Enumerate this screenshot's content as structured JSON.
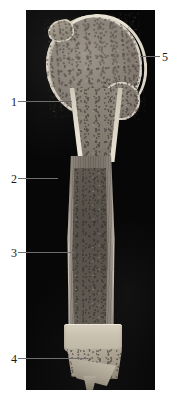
{
  "figure": {
    "background_color": "#ffffff",
    "panel_color": "#070707",
    "leader_line_color": "#6e6e6e",
    "numeral_color": "#1a1a1a",
    "specimen": "longitudinal section of a long bone (humerus)",
    "panel": {
      "x": 26,
      "y": 10,
      "width": 129,
      "height": 380
    }
  },
  "callouts": [
    {
      "id": "callout-1",
      "label": "1",
      "side": "left",
      "number_x": 11,
      "number_y": 96,
      "line_x": 18,
      "line_y": 101,
      "line_length": 54
    },
    {
      "id": "callout-2",
      "label": "2",
      "side": "left",
      "number_x": 11,
      "number_y": 173,
      "line_x": 18,
      "line_y": 178,
      "line_length": 40
    },
    {
      "id": "callout-3",
      "label": "3",
      "side": "left",
      "number_x": 11,
      "number_y": 247,
      "line_x": 18,
      "line_y": 252,
      "line_length": 57
    },
    {
      "id": "callout-4",
      "label": "4",
      "side": "left",
      "number_x": 11,
      "number_y": 353,
      "line_x": 18,
      "line_y": 358,
      "line_length": 70
    },
    {
      "id": "callout-5",
      "label": "5",
      "side": "right",
      "number_x": 162,
      "number_y": 51,
      "line_x": 140,
      "line_y": 56,
      "line_length": 20
    }
  ]
}
